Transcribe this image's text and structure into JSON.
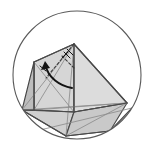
{
  "figure": {
    "title": "Polyhedron rotation diagram inside circle",
    "canvas": {
      "width": 156,
      "height": 154,
      "background": "#ffffff"
    },
    "circle": {
      "label": "bounding-circle",
      "cx": 77,
      "cy": 75,
      "r": 64,
      "stroke": "#5a5a5a",
      "stroke_width": 1.1,
      "fill": "none"
    },
    "palette": {
      "outline": "#4a4a4a",
      "outline_light": "#8d8d8d",
      "circle_stroke": "#5a5a5a",
      "arrow": "#141414",
      "face_light": "#e2e2e2",
      "face_mid": "#d4d4d4",
      "face_dark": "#bfbfbf",
      "face_darkest": "#ababab",
      "background": "#ffffff"
    },
    "vertices": {
      "apex_top": {
        "x": 74,
        "y": 44
      },
      "left_top": {
        "x": 34,
        "y": 62
      },
      "left_bottom": {
        "x": 34,
        "y": 110
      },
      "mid_bottom": {
        "x": 74,
        "y": 112
      },
      "right_far": {
        "x": 127,
        "y": 103
      },
      "lower_left_rim": {
        "x": 22,
        "y": 110
      },
      "lower_right_rim": {
        "x": 110,
        "y": 131
      },
      "bottom_mid_rim": {
        "x": 66,
        "y": 136
      },
      "right_edge_rim": {
        "x": 132,
        "y": 108
      }
    },
    "faces": [
      {
        "name": "face-left-upper",
        "fill": "#d6d6d6",
        "points": "34,62 74,44 74,112 34,110"
      },
      {
        "name": "face-top-right",
        "fill": "#dcdcdc",
        "points": "74,44 127,103 74,112"
      },
      {
        "name": "face-bottom-left",
        "fill": "#d0d0d0",
        "points": "22,110 74,112 66,136"
      },
      {
        "name": "face-bottom-right",
        "fill": "#c9c9c9",
        "points": "74,112 127,103 110,131 66,136"
      },
      {
        "name": "face-left-sliver",
        "fill": "#bdbdbd",
        "points": "22,110 34,110 34,62"
      }
    ],
    "edges": [
      {
        "name": "edge-apex-to-left-top",
        "d": "M 74,44 L 34,62"
      },
      {
        "name": "edge-apex-to-right-far",
        "d": "M 74,44 L 127,103"
      },
      {
        "name": "edge-apex-vertical",
        "d": "M 74,44 L 74,112"
      },
      {
        "name": "edge-left-vertical",
        "d": "M 34,62 L 34,110"
      },
      {
        "name": "edge-left-bottom-span",
        "d": "M 34,110 L 74,112"
      },
      {
        "name": "edge-right-far-to-mid",
        "d": "M 127,103 L 74,112"
      },
      {
        "name": "edge-base-left-rim",
        "d": "M 22,110 L 34,110"
      },
      {
        "name": "edge-base-to-bottom-rim",
        "d": "M 22,110 L 66,136"
      },
      {
        "name": "edge-bottom-rim-span",
        "d": "M 66,136 L 110,131"
      },
      {
        "name": "edge-right-rim-up",
        "d": "M 110,131 L 132,108"
      }
    ],
    "edges_thin": [
      {
        "name": "edge-thin-left-diag-a",
        "d": "M 34,62 L 74,112"
      },
      {
        "name": "edge-thin-left-diag-b",
        "d": "M 34,110 L 74,44"
      },
      {
        "name": "edge-thin-fan-left",
        "d": "M 22,110 L 74,44"
      },
      {
        "name": "edge-thin-fan-bottom",
        "d": "M 66,136 L 74,44"
      },
      {
        "name": "edge-thin-base-horizontal",
        "d": "M 22,110 L 127,103"
      },
      {
        "name": "edge-thin-right-fan-a",
        "d": "M 127,103 L 66,136"
      },
      {
        "name": "edge-thin-right-fan-b",
        "d": "M 127,103 L 34,110"
      },
      {
        "name": "edge-thin-right-fan-c",
        "d": "M 132,108 L 40,130"
      }
    ],
    "edges_dashed": [
      {
        "name": "hidden-edge-apex-to-interior",
        "d": "M 74,44 L 46,78"
      },
      {
        "name": "hidden-edge-interior-diagonal",
        "d": "M 62,56 L 74,68"
      }
    ],
    "arrow": {
      "name": "rotation-arrow",
      "path": "M 72,88 C 60,86 48,78 45,64",
      "head_points": "45,61 41,70 50,68",
      "stroke": "#141414",
      "stroke_width": 1.9,
      "direction": "counter-clockwise"
    },
    "angle_ticks": [
      {
        "name": "angle-tick-apex-a",
        "d": "M 64,52 L 70,58"
      },
      {
        "name": "angle-tick-apex-b",
        "d": "M 67,49 L 73,55"
      },
      {
        "name": "angle-tick-apex-c",
        "d": "M 62,58 L 68,52"
      },
      {
        "name": "angle-tick-left-a",
        "d": "M 40,66 L 46,71"
      }
    ]
  }
}
